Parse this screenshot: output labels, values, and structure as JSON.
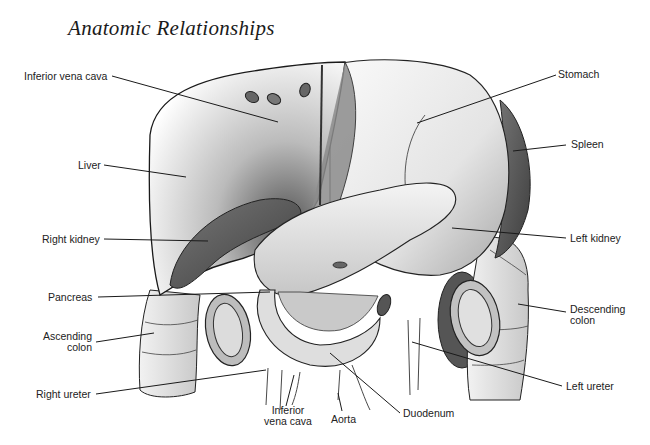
{
  "title": "Anatomic Relationships",
  "labels": {
    "inferior_vena_cava_top": "Inferior vena cava",
    "liver": "Liver",
    "right_kidney": "Right kidney",
    "pancreas": "Pancreas",
    "ascending_colon": "Ascending\ncolon",
    "right_ureter": "Right ureter",
    "inferior_vena_cava_bottom": "Inferior\nvena cava",
    "aorta": "Aorta",
    "duodenum": "Duodenum",
    "left_ureter": "Left ureter",
    "descending_colon": "Descending\ncolon",
    "left_kidney": "Left kidney",
    "spleen": "Spleen",
    "stomach": "Stomach"
  },
  "colors": {
    "line": "#1a1a1a",
    "organ_dark": "#5a5a5a",
    "organ_mid": "#9a9a9a",
    "organ_light": "#e6e6e6"
  }
}
